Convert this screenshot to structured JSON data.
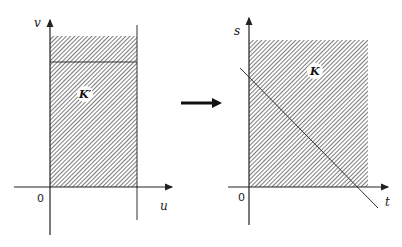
{
  "figure": {
    "arrow": "transformation-arrow",
    "left_panel": {
      "x_axis_label": "u",
      "y_axis_label": "v",
      "origin_label": "0",
      "region_label": "K′"
    },
    "right_panel": {
      "x_axis_label": "t",
      "y_axis_label": "s",
      "origin_label": "0",
      "region_label": "K"
    }
  },
  "colors": {
    "stroke": "#222222",
    "hatch": "#555555",
    "background": "#ffffff"
  }
}
